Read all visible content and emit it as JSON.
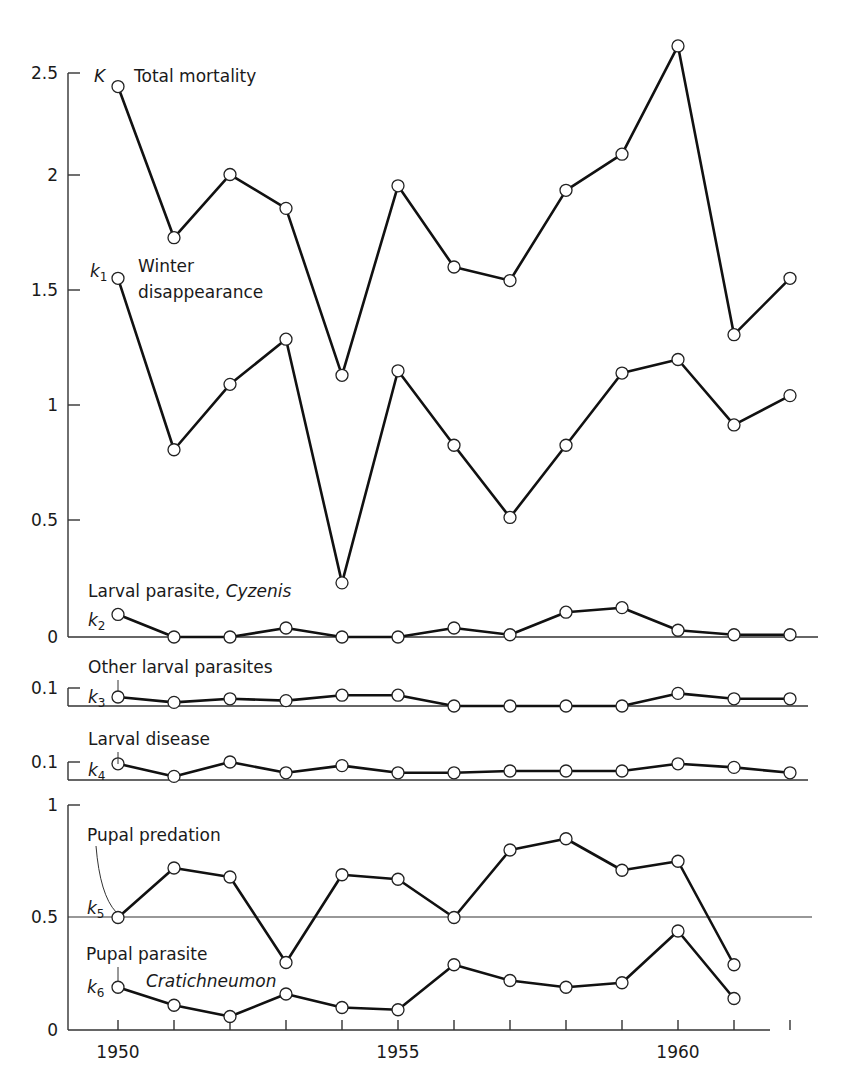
{
  "chart_data": {
    "type": "line",
    "title": "",
    "xlabel": "",
    "ylabel": "",
    "x": [
      1950,
      1951,
      1952,
      1953,
      1954,
      1955,
      1956,
      1957,
      1958,
      1959,
      1960,
      1961,
      1962
    ],
    "x_ticks": [
      "1950",
      "1955",
      "1960"
    ],
    "panels": [
      {
        "name": "top",
        "ylim": [
          0,
          2.5
        ],
        "y_ticks": [
          "0",
          "0.5",
          "1",
          "1.5",
          "2",
          "2.5"
        ],
        "series": [
          {
            "name": "Total mortality",
            "symbol": "K",
            "values": [
              2.44,
              1.77,
              2.05,
              1.9,
              1.16,
              2.0,
              1.64,
              1.58,
              1.98,
              2.14,
              2.62,
              1.34,
              1.59
            ]
          },
          {
            "name": "Winter disappearance",
            "symbol": "k1",
            "values": [
              1.59,
              0.83,
              1.12,
              1.32,
              0.24,
              1.18,
              0.85,
              0.53,
              0.85,
              1.17,
              1.23,
              0.94,
              1.07
            ]
          },
          {
            "name": "Larval parasite, Cyzenis",
            "symbol": "k2",
            "values": [
              0.1,
              0,
              0,
              0.04,
              0,
              0,
              0.04,
              0.01,
              0.11,
              0.13,
              0.03,
              0.01,
              0.01
            ]
          }
        ]
      },
      {
        "name": "k3-panel",
        "ylim": [
          0,
          0.1
        ],
        "y_ticks": [
          "0.1"
        ],
        "series": [
          {
            "name": "Other larval parasites",
            "symbol": "k3",
            "values": [
              0.05,
              0.02,
              0.04,
              0.03,
              0.06,
              0.06,
              0,
              0,
              0,
              0,
              0.07,
              0.04,
              0.04
            ]
          }
        ]
      },
      {
        "name": "k4-panel",
        "ylim": [
          0,
          0.1
        ],
        "y_ticks": [
          "0.1"
        ],
        "series": [
          {
            "name": "Larval disease",
            "symbol": "k4",
            "values": [
              0.09,
              0.02,
              0.1,
              0.04,
              0.08,
              0.04,
              0.04,
              0.05,
              0.05,
              0.05,
              0.09,
              0.07,
              0.04
            ]
          }
        ]
      },
      {
        "name": "bottom",
        "ylim": [
          0,
          1
        ],
        "y_ticks": [
          "0",
          "0.5",
          "1"
        ],
        "reference_line": 0.5,
        "series": [
          {
            "name": "Pupal predation",
            "symbol": "k5",
            "values": [
              0.5,
              0.72,
              0.68,
              0.3,
              0.69,
              0.67,
              0.5,
              0.8,
              0.85,
              0.71,
              0.75,
              0.29
            ]
          },
          {
            "name": "Pupal parasite Cratichneumon",
            "symbol": "k6",
            "values": [
              0.19,
              0.11,
              0.06,
              0.16,
              0.1,
              0.09,
              0.29,
              0.22,
              0.19,
              0.21,
              0.44,
              0.14
            ]
          }
        ]
      }
    ],
    "grid": false,
    "legend": "inline annotations"
  },
  "labels": {
    "K_symbol": "K",
    "K_name": "Total mortality",
    "k1_symbol": "k",
    "k1_sub": "1",
    "k1_name_line1": "Winter",
    "k1_name_line2": "disappearance",
    "k2_name": "Larval parasite, ",
    "k2_name_it": "Cyzenis",
    "k2_symbol": "k",
    "k2_sub": "2",
    "k3_name": "Other larval parasites",
    "k3_symbol": "k",
    "k3_sub": "3",
    "k4_name": "Larval disease",
    "k4_symbol": "k",
    "k4_sub": "4",
    "k5_name": "Pupal predation",
    "k5_symbol": "k",
    "k5_sub": "5",
    "k6_name": "Pupal parasite",
    "k6_name_it": "Cratichneumon",
    "k6_symbol": "k",
    "k6_sub": "6"
  },
  "ticks": {
    "top": [
      "2.5",
      "2",
      "1.5",
      "1",
      "0.5",
      "0"
    ],
    "k3": "0.1",
    "k4": "0.1",
    "bottom": [
      "1",
      "0.5",
      "0"
    ],
    "x": [
      "1950",
      "1955",
      "1960"
    ]
  }
}
